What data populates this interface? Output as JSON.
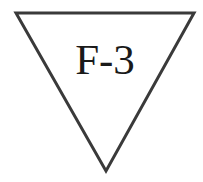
{
  "diagram": {
    "shape": "inverted-triangle",
    "label": "F-3",
    "stroke_color": "#3a3a3a",
    "fill_color": "#ffffff",
    "text_color": "#1a1a1a"
  }
}
